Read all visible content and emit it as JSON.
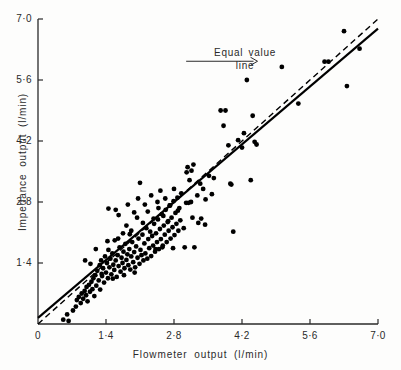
{
  "chart_data": {
    "type": "scatter",
    "title": "",
    "xlabel": "Flowmeter  output  (l/min)",
    "ylabel": "Impedance  output  (l/min)",
    "xlim": [
      0,
      7.0
    ],
    "ylim": [
      0,
      7.0
    ],
    "grid": false,
    "legend_position": "none",
    "x_ticks": [
      {
        "value": 0,
        "label": "0"
      },
      {
        "value": 1.4,
        "label": "1·4"
      },
      {
        "value": 2.8,
        "label": "2·8"
      },
      {
        "value": 4.2,
        "label": "4·2"
      },
      {
        "value": 5.6,
        "label": "5·6"
      },
      {
        "value": 7.0,
        "label": "7·0"
      }
    ],
    "y_ticks": [
      {
        "value": 1.4,
        "label": "1·4"
      },
      {
        "value": 2.8,
        "label": "2·8"
      },
      {
        "value": 4.2,
        "label": "4·2"
      },
      {
        "value": 5.6,
        "label": "5·6"
      },
      {
        "value": 7.0,
        "label": "7·0"
      }
    ],
    "annotations": [
      {
        "text": "Equal value\nline",
        "line1": "Equal value",
        "line2": "line",
        "arrow_from_x": 3.05,
        "arrow_from_y": 6.03,
        "arrow_to_x": 4.52,
        "arrow_to_y": 6.03,
        "points_to": "equal-value-line"
      }
    ],
    "series": [
      {
        "name": "Regression line",
        "type": "line",
        "style": "solid",
        "color": "#000000",
        "x": [
          0.0,
          7.0
        ],
        "y": [
          0.14,
          6.78
        ]
      },
      {
        "name": "Equal value line",
        "type": "line",
        "style": "dashed",
        "color": "#000000",
        "x": [
          0.0,
          7.0
        ],
        "y": [
          0.0,
          7.0
        ]
      },
      {
        "name": "Paired measurements",
        "type": "scatter",
        "marker": "filled-circle",
        "color": "#000000",
        "n_points": 186,
        "points": [
          [
            0.52,
            0.1
          ],
          [
            0.6,
            0.22
          ],
          [
            0.63,
            0.07
          ],
          [
            0.72,
            0.31
          ],
          [
            0.78,
            0.4
          ],
          [
            0.8,
            0.55
          ],
          [
            0.84,
            0.62
          ],
          [
            0.88,
            0.48
          ],
          [
            0.9,
            0.7
          ],
          [
            0.93,
            0.58
          ],
          [
            0.96,
            0.76
          ],
          [
            0.99,
            0.66
          ],
          [
            1.0,
            0.85
          ],
          [
            1.02,
            0.52
          ],
          [
            1.05,
            0.9
          ],
          [
            1.07,
            0.74
          ],
          [
            1.1,
            0.97
          ],
          [
            1.12,
            0.8
          ],
          [
            1.14,
            1.05
          ],
          [
            1.16,
            0.64
          ],
          [
            1.18,
            1.12
          ],
          [
            1.2,
            0.88
          ],
          [
            1.22,
            1.22
          ],
          [
            1.25,
            1.0
          ],
          [
            1.27,
            1.35
          ],
          [
            1.28,
            0.79
          ],
          [
            1.3,
            1.46
          ],
          [
            1.32,
            1.1
          ],
          [
            1.34,
            1.28
          ],
          [
            1.36,
            0.95
          ],
          [
            1.38,
            1.55
          ],
          [
            1.4,
            1.18
          ],
          [
            1.42,
            1.4
          ],
          [
            1.44,
            1.05
          ],
          [
            1.45,
            1.7
          ],
          [
            1.47,
            1.3
          ],
          [
            1.49,
            1.5
          ],
          [
            1.51,
            1.14
          ],
          [
            1.53,
            1.62
          ],
          [
            1.55,
            1.36
          ],
          [
            1.57,
            1.24
          ],
          [
            1.58,
            1.92
          ],
          [
            1.6,
            1.46
          ],
          [
            1.62,
            1.08
          ],
          [
            1.64,
            1.58
          ],
          [
            1.66,
            1.33
          ],
          [
            1.68,
            1.76
          ],
          [
            1.7,
            1.2
          ],
          [
            1.72,
            1.52
          ],
          [
            1.74,
            1.4
          ],
          [
            1.76,
            1.66
          ],
          [
            1.78,
            1.28
          ],
          [
            1.8,
            1.84
          ],
          [
            1.82,
            1.47
          ],
          [
            1.84,
            1.6
          ],
          [
            1.86,
            1.35
          ],
          [
            1.88,
            1.72
          ],
          [
            1.9,
            1.25
          ],
          [
            1.92,
            1.55
          ],
          [
            1.94,
            1.88
          ],
          [
            1.96,
            1.42
          ],
          [
            1.98,
            1.65
          ],
          [
            2.0,
            1.3
          ],
          [
            2.02,
            1.78
          ],
          [
            2.05,
            1.52
          ],
          [
            2.07,
            1.96
          ],
          [
            2.09,
            1.38
          ],
          [
            2.11,
            1.7
          ],
          [
            2.13,
            1.58
          ],
          [
            2.15,
            2.05
          ],
          [
            2.17,
            1.46
          ],
          [
            2.19,
            1.85
          ],
          [
            2.21,
            1.62
          ],
          [
            2.23,
            2.2
          ],
          [
            2.25,
            1.5
          ],
          [
            2.27,
            1.95
          ],
          [
            2.29,
            1.74
          ],
          [
            2.31,
            2.12
          ],
          [
            2.33,
            1.56
          ],
          [
            2.35,
            2.02
          ],
          [
            2.37,
            1.8
          ],
          [
            2.39,
            2.3
          ],
          [
            2.41,
            1.66
          ],
          [
            2.43,
            2.08
          ],
          [
            2.45,
            1.88
          ],
          [
            2.47,
            2.4
          ],
          [
            2.49,
            1.72
          ],
          [
            2.51,
            2.18
          ],
          [
            2.53,
            1.95
          ],
          [
            2.55,
            2.52
          ],
          [
            2.57,
            1.8
          ],
          [
            2.59,
            2.26
          ],
          [
            2.61,
            2.05
          ],
          [
            2.63,
            2.62
          ],
          [
            2.65,
            1.88
          ],
          [
            2.67,
            2.34
          ],
          [
            2.69,
            2.14
          ],
          [
            2.71,
            2.72
          ],
          [
            2.73,
            1.96
          ],
          [
            2.75,
            2.44
          ],
          [
            2.77,
            2.22
          ],
          [
            2.79,
            2.82
          ],
          [
            2.81,
            2.04
          ],
          [
            2.83,
            2.55
          ],
          [
            2.85,
            2.3
          ],
          [
            2.87,
            2.9
          ],
          [
            2.89,
            2.14
          ],
          [
            2.91,
            2.66
          ],
          [
            2.93,
            2.38
          ],
          [
            2.95,
            3.0
          ],
          [
            0.97,
            1.46
          ],
          [
            1.08,
            1.38
          ],
          [
            1.19,
            1.72
          ],
          [
            1.31,
            1.15
          ],
          [
            1.43,
            1.9
          ],
          [
            1.54,
            1.04
          ],
          [
            1.65,
            1.96
          ],
          [
            1.77,
            1.12
          ],
          [
            1.89,
            2.06
          ],
          [
            1.99,
            1.18
          ],
          [
            1.45,
            2.65
          ],
          [
            1.6,
            2.62
          ],
          [
            1.66,
            2.5
          ],
          [
            1.85,
            2.74
          ],
          [
            1.98,
            2.56
          ],
          [
            2.1,
            3.24
          ],
          [
            2.06,
            2.88
          ],
          [
            2.2,
            2.74
          ],
          [
            2.33,
            2.95
          ],
          [
            2.46,
            2.8
          ],
          [
            2.52,
            3.06
          ],
          [
            2.62,
            2.88
          ],
          [
            2.72,
            2.72
          ],
          [
            2.8,
            3.1
          ],
          [
            2.88,
            2.6
          ],
          [
            1.75,
            2.08
          ],
          [
            1.82,
            2.26
          ],
          [
            1.92,
            2.14
          ],
          [
            2.04,
            2.44
          ],
          [
            2.16,
            2.32
          ],
          [
            2.26,
            2.58
          ],
          [
            2.38,
            2.42
          ],
          [
            2.48,
            2.66
          ],
          [
            2.58,
            2.48
          ],
          [
            2.68,
            2.36
          ],
          [
            2.42,
            1.72
          ],
          [
            2.56,
            1.76
          ],
          [
            2.78,
            1.74
          ],
          [
            3.02,
            1.76
          ],
          [
            3.22,
            1.76
          ],
          [
            3.0,
            2.2
          ],
          [
            3.05,
            2.78
          ],
          [
            3.1,
            2.78
          ],
          [
            3.15,
            2.8
          ],
          [
            3.18,
            2.44
          ],
          [
            3.12,
            3.3
          ],
          [
            3.16,
            3.52
          ],
          [
            3.2,
            3.66
          ],
          [
            3.08,
            3.6
          ],
          [
            3.06,
            3.48
          ],
          [
            3.28,
            2.95
          ],
          [
            3.34,
            3.22
          ],
          [
            3.4,
            3.1
          ],
          [
            3.45,
            2.86
          ],
          [
            3.52,
            3.4
          ],
          [
            3.58,
            2.98
          ],
          [
            3.62,
            3.35
          ],
          [
            3.3,
            2.32
          ],
          [
            3.36,
            2.42
          ],
          [
            3.44,
            2.28
          ],
          [
            3.76,
            4.9
          ],
          [
            3.86,
            4.9
          ],
          [
            3.82,
            4.55
          ],
          [
            3.92,
            4.1
          ],
          [
            3.96,
            3.22
          ],
          [
            3.98,
            3.2
          ],
          [
            4.02,
            2.12
          ],
          [
            4.12,
            4.22
          ],
          [
            4.2,
            4.05
          ],
          [
            4.24,
            4.38
          ],
          [
            4.3,
            5.6
          ],
          [
            4.38,
            3.3
          ],
          [
            4.42,
            4.78
          ],
          [
            4.46,
            4.18
          ],
          [
            4.5,
            4.12
          ],
          [
            5.02,
            5.9
          ],
          [
            5.36,
            5.06
          ],
          [
            5.9,
            6.02
          ],
          [
            5.98,
            6.02
          ],
          [
            6.3,
            6.72
          ],
          [
            6.36,
            5.46
          ],
          [
            6.62,
            6.32
          ]
        ]
      }
    ]
  },
  "axes": {
    "x_axis_name": "flowmeter-output-axis",
    "y_axis_name": "impedance-output-axis"
  }
}
